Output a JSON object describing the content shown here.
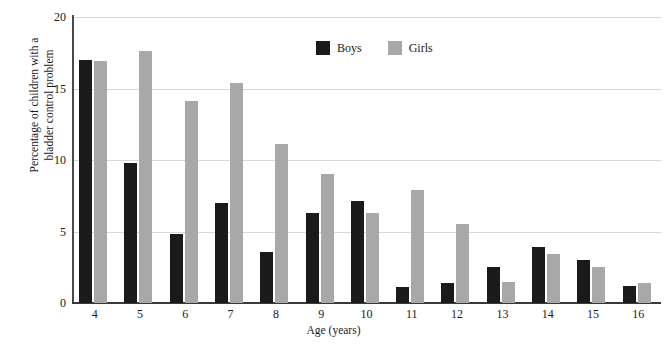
{
  "chart_data": {
    "type": "bar",
    "title": "",
    "xlabel": "Age (years)",
    "ylabel": "Percentage of children with a bladder control problem",
    "ylabel_lines": [
      "Percentage of children with a",
      "bladder control problem"
    ],
    "categories": [
      "4",
      "5",
      "6",
      "7",
      "8",
      "9",
      "10",
      "11",
      "12",
      "13",
      "14",
      "15",
      "16"
    ],
    "series": [
      {
        "name": "Boys",
        "color": "#1a1a1a",
        "values": [
          17.0,
          9.8,
          4.8,
          7.0,
          3.6,
          6.3,
          7.1,
          1.1,
          1.4,
          2.5,
          3.9,
          3.0,
          1.2
        ]
      },
      {
        "name": "Girls",
        "color": "#a8a8a8",
        "values": [
          16.9,
          17.6,
          14.1,
          15.4,
          11.1,
          9.0,
          6.3,
          7.9,
          5.5,
          1.5,
          3.4,
          2.5,
          1.4
        ]
      }
    ],
    "ylim": [
      0,
      20
    ],
    "yticks": [
      0,
      5,
      10,
      15,
      20
    ],
    "ytick_labels": [
      "0",
      "5",
      "10",
      "15",
      "20"
    ],
    "grid": "horizontal",
    "legend_position": "top-center",
    "legend": [
      "Boys",
      "Girls"
    ]
  },
  "colors": {
    "boys": "#1a1a1a",
    "girls": "#a8a8a8",
    "gridline": "#d8d8d8",
    "axis": "#3a3a3a",
    "text": "#1a1a1a",
    "background": "#ffffff"
  }
}
